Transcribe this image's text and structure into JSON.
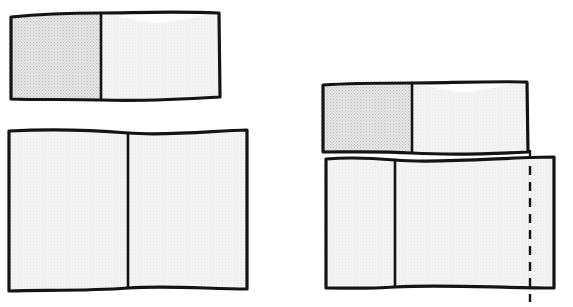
{
  "figure": {
    "background_color": "#ffffff",
    "stroke_color": "#141414",
    "stroke_width": 3.2,
    "divider_stroke_width": 2.6,
    "dashed_stroke_width": 2.4,
    "shaded_fill": "#e2e2e2",
    "plain_fill": "#f1f1f1",
    "unshaded_fill": "#fafafa",
    "texture": {
      "name": "fine-diagonal-stipple",
      "dot_color": "#bdbdbd",
      "spacing": 3
    },
    "shapes": [
      {
        "id": "top-left-card",
        "name": "top-left-shaded-card",
        "label": "",
        "outline": "M 11 17 C 40 14, 72 13, 101 13 C 132 13, 168 11, 219 13 L 220 97 C 170 100, 130 101, 101 100 C 70 99, 38 100, 11 99 Z",
        "panels": [
          {
            "id": "top-left-panel-left",
            "name": "top-left-card-left-panel",
            "shaded": true,
            "path": "M 11 17 C 40 14, 72 13, 101 13 L 101 100 C 70 99, 38 100, 11 99 Z"
          },
          {
            "id": "top-left-panel-right",
            "name": "top-left-card-right-panel",
            "shaded": false,
            "path": "M 101 13 C 124 16, 142 23, 160 23 C 180 23, 200 14, 219 13 L 220 97 C 170 100, 130 101, 101 100 Z"
          }
        ],
        "divider": "M 101 13 L 101 100"
      },
      {
        "id": "bottom-left-card",
        "name": "bottom-left-plain-card",
        "label": "",
        "outline": "M 9 131 C 46 129, 92 130, 128 133 C 168 136, 212 131, 247 130 L 247 289 C 210 289, 166 285, 128 288 C 90 291, 44 290, 9 291 Z",
        "panels": [
          {
            "id": "bottom-left-panel-left",
            "name": "bottom-left-card-left-panel",
            "shaded": false,
            "path": "M 9 131 C 46 129, 92 130, 128 133 L 128 288 C 90 291, 44 290, 9 291 Z"
          },
          {
            "id": "bottom-left-panel-right",
            "name": "bottom-left-card-right-panel",
            "shaded": false,
            "path": "M 128 133 C 168 136, 212 131, 247 130 L 247 289 C 210 289, 166 285, 128 288 Z"
          }
        ],
        "divider": "M 128 133 L 128 288"
      },
      {
        "id": "top-right-card",
        "name": "top-right-shaded-card",
        "label": "",
        "outline": "M 323 85 C 352 83, 385 83, 412 83 C 443 83, 492 81, 527 82 L 528 152 C 490 154, 446 155, 412 153 C 380 151, 350 152, 323 152 Z",
        "panels": [
          {
            "id": "top-right-panel-left",
            "name": "top-right-card-left-panel",
            "shaded": true,
            "path": "M 323 85 C 352 83, 385 83, 412 83 L 412 153 C 380 151, 350 152, 323 152 Z"
          },
          {
            "id": "top-right-panel-right",
            "name": "top-right-card-right-panel",
            "shaded": false,
            "path": "M 412 83 C 432 86, 448 93, 466 92 C 488 91, 508 82, 527 82 L 528 152 C 490 154, 446 155, 412 153 Z"
          }
        ],
        "divider": "M 412 83 L 412 153"
      },
      {
        "id": "bottom-right-card",
        "name": "bottom-right-plain-card",
        "label": "",
        "outline": "M 326 159 C 350 157, 372 158, 395 160 C 437 164, 510 157, 554 157 L 554 288 C 500 288, 440 284, 395 287 C 366 289, 348 288, 326 288 Z",
        "panels": [
          {
            "id": "bottom-right-panel-left",
            "name": "bottom-right-card-left-panel",
            "shaded": false,
            "path": "M 326 159 C 350 157, 372 158, 395 160 L 395 287 C 366 289, 348 288, 326 288 Z"
          },
          {
            "id": "bottom-right-panel-right",
            "name": "bottom-right-card-right-panel",
            "shaded": false,
            "path": "M 395 160 C 437 164, 510 157, 554 157 L 554 288 C 500 288, 440 284, 395 287 Z"
          }
        ],
        "divider": "M 395 160 L 395 287"
      }
    ],
    "dashed_line": {
      "id": "fold-guide-line",
      "name": "vertical-dashed-fold-line",
      "orientation": "vertical",
      "x": 530,
      "y_start": 150,
      "y_end": 302,
      "dash_pattern": "9 7",
      "color": "#141414"
    }
  }
}
